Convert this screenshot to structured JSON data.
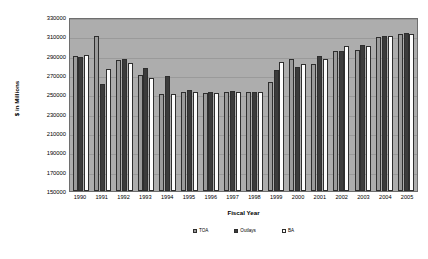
{
  "chart_data": {
    "type": "bar",
    "title": "",
    "xlabel": "Fiscal Year",
    "ylabel": "$ in Millions",
    "ylim": [
      150000,
      330000
    ],
    "yticks": [
      330000,
      310000,
      290000,
      270000,
      250000,
      230000,
      210000,
      190000,
      170000,
      150000
    ],
    "grid": true,
    "legend_position": "bottom",
    "categories": [
      "1990",
      "1991",
      "1992",
      "1993",
      "1994",
      "1995",
      "1996",
      "1997",
      "1998",
      "1999",
      "2000",
      "2001",
      "2002",
      "2003",
      "2004",
      "2005"
    ],
    "series": [
      {
        "name": "TOA",
        "values": [
          290000,
          310500,
          286000,
          270000,
          250500,
          252000,
          251500,
          252500,
          252000,
          263000,
          287000,
          281500,
          295000,
          296000,
          309000,
          312000
        ]
      },
      {
        "name": "Outlays",
        "values": [
          289000,
          261000,
          287000,
          277000,
          269000,
          254500,
          252000,
          253000,
          252500,
          275000,
          278000,
          290000,
          294500,
          301000,
          310000,
          313000
        ]
      },
      {
        "name": "BA",
        "values": [
          291000,
          276000,
          282000,
          266500,
          250500,
          252500,
          251500,
          252500,
          252000,
          283000,
          281000,
          287000,
          300500,
          300000,
          310500,
          312500
        ]
      }
    ]
  },
  "axes": {
    "y_title": "$ in Millions",
    "x_title": "Fiscal Year"
  },
  "legend": {
    "items": [
      {
        "label": "TOA"
      },
      {
        "label": "Outlays"
      },
      {
        "label": "BA"
      }
    ]
  }
}
